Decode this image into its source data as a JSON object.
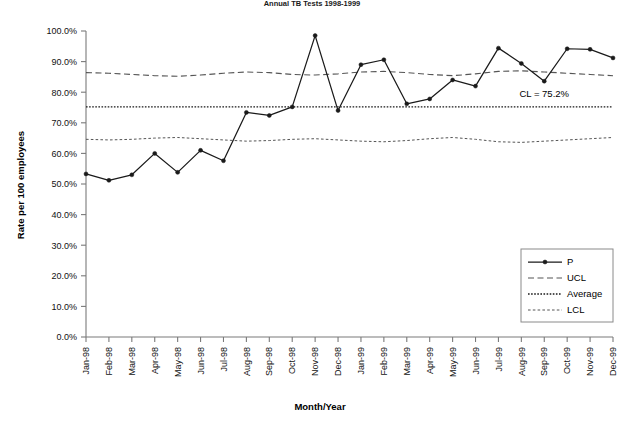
{
  "chart_data": {
    "type": "line",
    "title": "Annual TB Tests 1998-1999",
    "xlabel": "Month/Year",
    "ylabel": "Rate per 100 employees",
    "ylim": [
      0,
      100
    ],
    "ytick_labels": [
      "0.0%",
      "10.0%",
      "20.0%",
      "30.0%",
      "40.0%",
      "50.0%",
      "60.0%",
      "70.0%",
      "80.0%",
      "90.0%",
      "100.0%"
    ],
    "ytick_values": [
      0,
      10,
      20,
      30,
      40,
      50,
      60,
      70,
      80,
      90,
      100
    ],
    "categories": [
      "Jan-98",
      "Feb-98",
      "Mar-98",
      "Apr-98",
      "May-98",
      "Jun-98",
      "Jul-98",
      "Aug-98",
      "Sep-98",
      "Oct-98",
      "Nov-98",
      "Dec-98",
      "Jan-99",
      "Feb-99",
      "Mar-99",
      "Apr-99",
      "May-99",
      "Jun-99",
      "Jul-99",
      "Aug-99",
      "Sep-99",
      "Oct-99",
      "Nov-99",
      "Dec-99"
    ],
    "grid": false,
    "legend_position": "bottom-right",
    "series": [
      {
        "name": "P",
        "style": "solid-marker",
        "values": [
          53.3,
          51.2,
          53.0,
          60.0,
          53.8,
          61.0,
          57.6,
          73.4,
          72.4,
          75.2,
          98.5,
          74.0,
          89.0,
          90.6,
          76.2,
          77.8,
          84.0,
          82.0,
          94.4,
          89.4,
          83.6,
          94.2,
          94.0,
          91.2
        ]
      },
      {
        "name": "UCL",
        "style": "dashed",
        "values": [
          86.4,
          86.2,
          85.8,
          85.4,
          85.2,
          85.6,
          86.2,
          86.6,
          86.4,
          85.8,
          85.6,
          86.0,
          86.6,
          86.8,
          86.4,
          85.8,
          85.4,
          86.0,
          86.8,
          87.0,
          86.6,
          86.2,
          85.8,
          85.4
        ]
      },
      {
        "name": "Average",
        "style": "dotted",
        "values": [
          75.2,
          75.2,
          75.2,
          75.2,
          75.2,
          75.2,
          75.2,
          75.2,
          75.2,
          75.2,
          75.2,
          75.2,
          75.2,
          75.2,
          75.2,
          75.2,
          75.2,
          75.2,
          75.2,
          75.2,
          75.2,
          75.2,
          75.2,
          75.2
        ]
      },
      {
        "name": "LCL",
        "style": "fine-dashed",
        "values": [
          64.6,
          64.4,
          64.6,
          65.0,
          65.2,
          64.8,
          64.4,
          64.0,
          64.2,
          64.6,
          64.8,
          64.4,
          64.0,
          63.8,
          64.2,
          64.8,
          65.2,
          64.6,
          63.8,
          63.6,
          64.0,
          64.4,
          64.8,
          65.2
        ]
      }
    ],
    "annotations": [
      {
        "text": "CL = 75.2%",
        "x_category": "Sep-99",
        "y_value": 78.5
      }
    ]
  },
  "legend": {
    "entries": [
      {
        "label": "P",
        "style": "solid-marker"
      },
      {
        "label": "UCL",
        "style": "dashed"
      },
      {
        "label": "Average",
        "style": "dotted"
      },
      {
        "label": "LCL",
        "style": "fine-dashed"
      }
    ]
  }
}
